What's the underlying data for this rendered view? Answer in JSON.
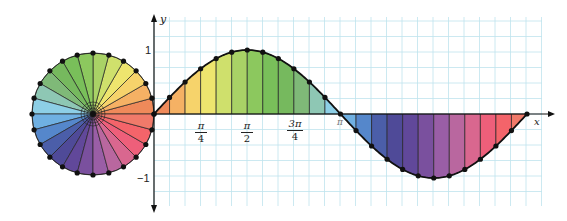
{
  "diagram": {
    "axes": {
      "x_label": "x",
      "y_label": "y",
      "y_tick_pos": "1",
      "y_tick_neg": "−1"
    },
    "x_ticks": [
      {
        "num": "π",
        "den": "4"
      },
      {
        "num": "π",
        "den": "2"
      },
      {
        "num": "3π",
        "den": "4"
      }
    ],
    "pi_label": "π",
    "segments": 24,
    "colors": [
      "#ef8a5a",
      "#f5b164",
      "#f6d36b",
      "#eee56e",
      "#cfe06c",
      "#a9d266",
      "#8cc85e",
      "#79bf5a",
      "#76b95e",
      "#7fb978",
      "#8ec7b4",
      "#8dcfe6",
      "#6fb0e2",
      "#5587cb",
      "#4b5ea9",
      "#4f4a98",
      "#61489a",
      "#7a509e",
      "#9a5ea6",
      "#b9679f",
      "#d9678f",
      "#ee5f7a",
      "#f4646a",
      "#f07a6a"
    ],
    "grid_color": "#bfe3ee",
    "curve_color": "#111111"
  }
}
